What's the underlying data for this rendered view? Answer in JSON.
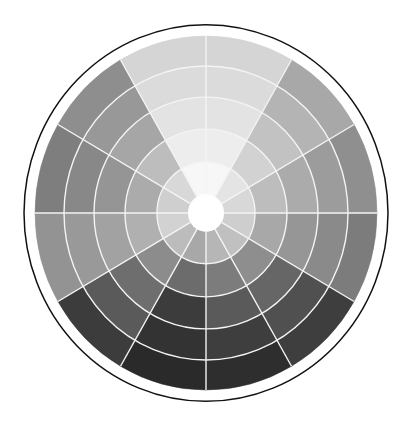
{
  "diagram": {
    "type": "value-wheel",
    "canvas": {
      "width": 409,
      "height": 422,
      "background": "#ffffff"
    },
    "center": {
      "x": 206,
      "y": 213
    },
    "scale_y": 1.035,
    "outer_circle": {
      "r": 182,
      "stroke": "#111111",
      "stroke_width": 1.5,
      "fill": "#ffffff"
    },
    "center_hole": {
      "r": 18,
      "fill": "#ffffff"
    },
    "ring_radii": [
      18,
      49,
      81,
      112,
      142,
      171
    ],
    "divider": {
      "color": "#f4f4f4",
      "width": 1.4
    },
    "sector_angle_deg": 30,
    "sectors": [
      {
        "position": "12-1 o'clock",
        "colors": [
          "#f7f7f7",
          "#ededed",
          "#e3e3e3",
          "#dbdbdb",
          "#d5d5d5"
        ]
      },
      {
        "position": "1-2 o'clock",
        "colors": [
          "#e4e4e4",
          "#d2d2d2",
          "#c2c2c2",
          "#b4b4b4",
          "#a8a8a8"
        ]
      },
      {
        "position": "2-3 o'clock",
        "colors": [
          "#d8d8d8",
          "#bdbdbd",
          "#ababab",
          "#9c9c9c",
          "#8f8f8f"
        ]
      },
      {
        "position": "3-4 o'clock",
        "colors": [
          "#cecece",
          "#a8a8a8",
          "#969696",
          "#8a8a8a",
          "#7c7c7c"
        ]
      },
      {
        "position": "4-5 o'clock",
        "colors": [
          "#c0c0c0",
          "#8e8e8e",
          "#666666",
          "#505050",
          "#3e3e3e"
        ]
      },
      {
        "position": "5-6 o'clock",
        "colors": [
          "#b6b6b6",
          "#7c7c7c",
          "#5a5a5a",
          "#3e3e3e",
          "#2e2e2e"
        ]
      },
      {
        "position": "6-7 o'clock",
        "colors": [
          "#a8a8a8",
          "#6c6c6c",
          "#3c3c3c",
          "#333333",
          "#2a2a2a"
        ]
      },
      {
        "position": "7-8 o'clock",
        "colors": [
          "#bcbcbc",
          "#8c8c8c",
          "#6e6e6e",
          "#5a5a5a",
          "#3c3c3c"
        ]
      },
      {
        "position": "8-9 o'clock",
        "colors": [
          "#d2d2d2",
          "#b0b0b0",
          "#a2a2a2",
          "#999999",
          "#939393"
        ]
      },
      {
        "position": "9-10 o'clock",
        "colors": [
          "#cfcfcf",
          "#ababab",
          "#959595",
          "#888888",
          "#7e7e7e"
        ]
      },
      {
        "position": "10-11 o'clock",
        "colors": [
          "#d8d8d8",
          "#bdbdbd",
          "#a6a6a6",
          "#989898",
          "#8e8e8e"
        ]
      },
      {
        "position": "11-12 o'clock",
        "colors": [
          "#f7f7f7",
          "#ededed",
          "#e3e3e3",
          "#dbdbdb",
          "#d5d5d5"
        ]
      }
    ]
  }
}
